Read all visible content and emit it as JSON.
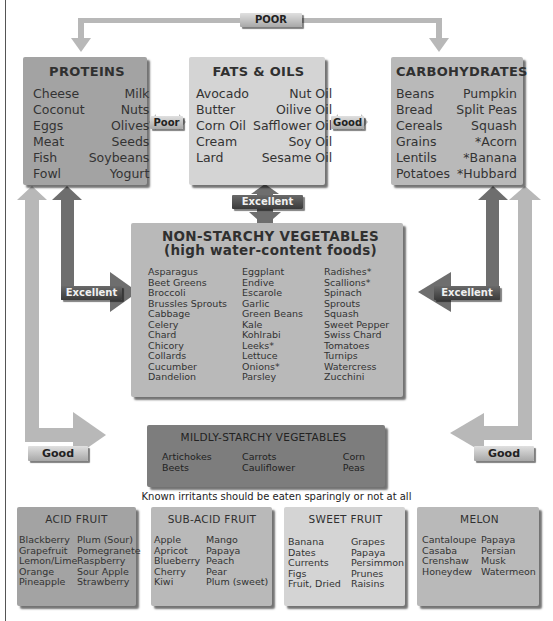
{
  "diagram": {
    "top_connector": {
      "label": "POOR"
    },
    "connectors": {
      "proteins_fats": "Poor",
      "fats_carbs": "Good",
      "fats_vegetables": "Excellent",
      "proteins_vegetables": "Excellent",
      "carbs_vegetables": "Excellent",
      "proteins_mildly": "Good",
      "carbs_mildly": "Good"
    },
    "colors": {
      "dark_box": "#a3a3a3",
      "light_box": "#d4d4d4",
      "medium_box": "#7d7d7d",
      "light_arrow": "#b8b8b8",
      "dark_arrow": "#6e6e6e"
    }
  },
  "proteins": {
    "title": "PROTEINS",
    "left": [
      "Cheese",
      "Coconut",
      "Eggs",
      "Meat",
      "Fish",
      "Fowl"
    ],
    "right": [
      "Milk",
      "Nuts",
      "Olives",
      "Seeds",
      "Soybeans",
      "Yogurt"
    ]
  },
  "fats": {
    "title": "FATS & OILS",
    "left": [
      "Avocado",
      "Butter",
      "Corn Oil",
      "Cream",
      "Lard"
    ],
    "right": [
      "Nut Oil",
      "Oilive Oil",
      "Safflower Oil",
      "Soy Oil",
      "Sesame Oil"
    ]
  },
  "carbs": {
    "title": "CARBOHYDRATES",
    "left": [
      "Beans",
      "Bread",
      "Cereals",
      "Grains",
      "Lentils",
      "Potatoes"
    ],
    "right": [
      "Pumpkin",
      "Split Peas",
      "Squash",
      "*Acorn",
      "*Banana",
      "*Hubbard"
    ]
  },
  "nonstarchy": {
    "title": "NON-STARCHY VEGETABLES",
    "subtitle": "(high water-content foods)",
    "col1": [
      "Asparagus",
      "Beet Greens",
      "Broccoli",
      "Brussles Sprouts",
      "Cabbage",
      "Celery",
      "Chard",
      "Chicory",
      "Collards",
      "Cucumber",
      "Dandelion"
    ],
    "col2": [
      "Eggplant",
      "Endive",
      "Escarole",
      "Garlic",
      "Green Beans",
      "Kale",
      "Kohlrabi",
      "Leeks*",
      "Lettuce",
      "Onions*",
      "Parsley"
    ],
    "col3": [
      "Radishes*",
      "Scallions*",
      "Spinach",
      "Sprouts",
      "Squash",
      "Sweet Pepper",
      "Swiss Chard",
      "Tomatoes",
      "Turnips",
      "Watercress",
      "Zucchini"
    ]
  },
  "mildly": {
    "title": "MILDLY-STARCHY VEGETABLES",
    "col1": [
      "Artichokes",
      "Beets"
    ],
    "col2": [
      "Carrots",
      "Cauliflower"
    ],
    "col3": [
      "Corn",
      "Peas"
    ]
  },
  "note": "Known irritants should be eaten sparingly or not at all",
  "acid_fruit": {
    "title": "ACID FRUIT",
    "left": [
      "Blackberry",
      "Grapefruit",
      "Lemon/Lime",
      "Orange",
      "Pineapple"
    ],
    "right": [
      "Plum (Sour)",
      "Pomegranete",
      "Raspberry",
      "Sour Apple",
      "Strawberry"
    ]
  },
  "subacid_fruit": {
    "title": "SUB-ACID FRUIT",
    "left": [
      "Apple",
      "Apricot",
      "Blueberry",
      "Cherry",
      "Kiwi"
    ],
    "right": [
      "Mango",
      "Papaya",
      "Peach",
      "Pear",
      "Plum (sweet)"
    ]
  },
  "sweet_fruit": {
    "title": "SWEET FRUIT",
    "left": [
      "Banana",
      "Dates",
      "Currents",
      "Figs",
      "Fruit, Dried"
    ],
    "right": [
      "Grapes",
      "Papaya",
      "Persimmon",
      "Prunes",
      "Raisins"
    ]
  },
  "melon": {
    "title": "MELON",
    "left": [
      "Cantaloupe",
      "Casaba",
      "Crenshaw",
      "Honeydew"
    ],
    "right": [
      "Papaya",
      "Persian",
      "Musk",
      "Watermeon"
    ]
  }
}
